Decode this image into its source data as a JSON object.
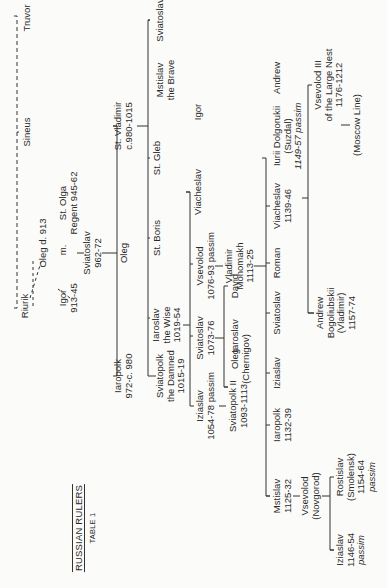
{
  "document": {
    "title": "RUSSIAN RULERS",
    "subtitle": "TABLE 1",
    "type": "genealogical table"
  },
  "generations": [
    {
      "level": 0,
      "members": [
        {
          "id": "riurik",
          "lines": [
            "Riurik"
          ]
        },
        {
          "id": "sineus",
          "lines": [
            "Sineus"
          ]
        },
        {
          "id": "truvor",
          "lines": [
            "Truvor"
          ]
        }
      ]
    },
    {
      "level": 1,
      "members": [
        {
          "id": "oleg913",
          "lines": [
            "Oleg  d. 913"
          ]
        },
        {
          "id": "igor",
          "lines": [
            "Igor",
            "913-45"
          ]
        },
        {
          "id": "marriage",
          "lines": [
            "m."
          ]
        },
        {
          "id": "olga",
          "lines": [
            "St. Olga",
            "Regent 945-62"
          ]
        }
      ]
    },
    {
      "level": 2,
      "members": [
        {
          "id": "sviatoslav962",
          "lines": [
            "Sviatoslav",
            "962-72"
          ]
        }
      ]
    },
    {
      "level": 3,
      "members": [
        {
          "id": "iaropolk972",
          "lines": [
            "Iaropolk",
            "972-c. 980"
          ]
        },
        {
          "id": "oleg_s",
          "lines": [
            "Oleg"
          ]
        },
        {
          "id": "vladimir",
          "lines": [
            "St. Vladimir",
            "c.980-1015"
          ]
        }
      ]
    },
    {
      "level": 4,
      "members": [
        {
          "id": "sviatopolk1015",
          "lines": [
            "Sviatopolk",
            "the Damned",
            "1015-19"
          ]
        },
        {
          "id": "iaroslav1019",
          "lines": [
            "Iaroslav",
            "the Wise",
            "1019-54"
          ]
        },
        {
          "id": "boris",
          "lines": [
            "St. Boris"
          ]
        },
        {
          "id": "gleb",
          "lines": [
            "St. Gleb"
          ]
        },
        {
          "id": "mstislav_brave",
          "lines": [
            "Mstislav",
            "the Brave"
          ]
        },
        {
          "id": "sviatoslav_v",
          "lines": [
            "Sviatoslav"
          ]
        }
      ]
    },
    {
      "level": 5,
      "members": [
        {
          "id": "iziaslav1054",
          "lines": [
            "Iziaslav",
            "1054-78 passim"
          ]
        },
        {
          "id": "sviatoslav1073",
          "lines": [
            "Sviatoslav",
            "1073-76"
          ]
        },
        {
          "id": "vsevolod1076",
          "lines": [
            "Vsevolod",
            "1076-93 passim"
          ]
        },
        {
          "id": "viacheslav_i",
          "lines": [
            "Viacheslav"
          ]
        },
        {
          "id": "igor_i",
          "lines": [
            "Igor"
          ]
        }
      ]
    },
    {
      "level": 6,
      "members": [
        {
          "id": "sviatopolk2",
          "lines": [
            "Sviatopolk II",
            "1093-1113"
          ]
        },
        {
          "id": "oleg_chernigov",
          "lines": [
            "Oleg",
            "(Chernigov)"
          ]
        },
        {
          "id": "iaroslav_s",
          "lines": [
            "Iaroslav"
          ]
        },
        {
          "id": "david",
          "lines": [
            "David"
          ]
        },
        {
          "id": "monomakh",
          "lines": [
            "Vladimir",
            "Monomakh",
            "1113-25"
          ]
        }
      ]
    },
    {
      "level": 7,
      "members": [
        {
          "id": "mstislav1125",
          "lines": [
            "Mstislav",
            "1125-32"
          ]
        },
        {
          "id": "iaropolk1132",
          "lines": [
            "Iaropolk",
            "1132-39"
          ]
        },
        {
          "id": "iziaslav_m",
          "lines": [
            "Iziaslav"
          ]
        },
        {
          "id": "sviatoslav_m",
          "lines": [
            "Sviatoslav"
          ]
        },
        {
          "id": "roman",
          "lines": [
            "Roman"
          ]
        },
        {
          "id": "viacheslav1139",
          "lines": [
            "Viacheslav",
            "1139-46"
          ]
        },
        {
          "id": "iurii",
          "lines": [
            "Iurii Dolgorukii",
            "(Suzdal)",
            "1149-57 passim"
          ]
        },
        {
          "id": "andrew_m",
          "lines": [
            "Andrew"
          ]
        }
      ]
    },
    {
      "level": 8,
      "members": [
        {
          "id": "vsevolod_novgorod",
          "lines": [
            "Vsevolod",
            "(Novgorod)"
          ]
        },
        {
          "id": "andrew_b",
          "lines": [
            "Andrew",
            "Bogoliubskii",
            "(Vladimir)",
            "1157-74"
          ]
        },
        {
          "id": "vsevolod3",
          "lines": [
            "Vsevolod III",
            "of the Large Nest",
            "1176-1212"
          ]
        }
      ]
    },
    {
      "level": 9,
      "members": [
        {
          "id": "iziaslav1146",
          "lines": [
            "Iziaslav",
            "1146-54",
            "passim"
          ]
        },
        {
          "id": "rostislav",
          "lines": [
            "Rostislav",
            "(Smolensk)",
            "1154-64",
            "passim"
          ]
        },
        {
          "id": "moscow",
          "lines": [
            "(Moscow Line)"
          ]
        }
      ]
    }
  ]
}
